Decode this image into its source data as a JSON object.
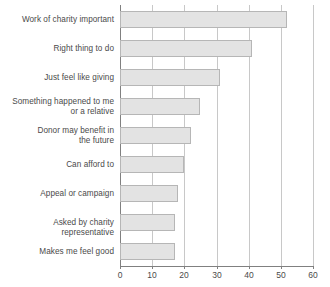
{
  "chart_data": {
    "type": "bar",
    "orientation": "horizontal",
    "title": "",
    "subtitle": "",
    "xlabel": "",
    "ylabel": "",
    "xlim": [
      0,
      60
    ],
    "xticks": [
      0,
      10,
      20,
      30,
      40,
      50,
      60
    ],
    "grid": "vertical",
    "legend": "none",
    "categories": [
      "Work of charity important",
      "Right thing to do",
      "Just feel like giving",
      "Something happened to me or a relative",
      "Donor may benefit in the future",
      "Can afford to",
      "Appeal or campaign",
      "Asked by charity representative",
      "Makes me feel good"
    ],
    "category_lines": [
      [
        "Work of charity important"
      ],
      [
        "Right thing to do"
      ],
      [
        "Just feel like giving"
      ],
      [
        "Something happened to me",
        "or a relative"
      ],
      [
        "Donor may benefit in",
        "the future"
      ],
      [
        "Can afford to"
      ],
      [
        "Appeal or campaign"
      ],
      [
        "Asked by charity representative"
      ],
      [
        "Makes me feel good"
      ]
    ],
    "values": [
      52,
      41,
      31,
      25,
      22,
      20,
      18,
      17,
      17
    ],
    "colors": {
      "bar_fill": "#e3e3e3",
      "bar_border": "#b6b6b6",
      "gridline": "#c8c8c8",
      "axis": "#808080",
      "text": "#4a4a4a",
      "background": "#ffffff"
    }
  }
}
